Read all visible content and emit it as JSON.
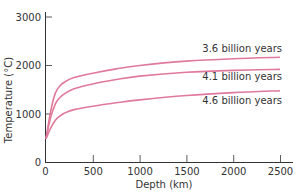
{
  "chart_data": {
    "type": "line",
    "title": "",
    "xlabel": "Depth (km)",
    "ylabel": "Temperature (°C)",
    "xlim": [
      0,
      2600
    ],
    "ylim": [
      0,
      3100
    ],
    "x_ticks": [
      0,
      500,
      1000,
      1500,
      2000,
      2500
    ],
    "y_ticks": [
      0,
      1000,
      2000,
      3000
    ],
    "x_tick_labels": [
      "0",
      "500",
      "1000",
      "1500",
      "2000",
      "2500"
    ],
    "y_tick_labels": [
      "0",
      "1000",
      "2000",
      "3000"
    ],
    "grid": false,
    "legend": "inline labels at right end of curves",
    "line_color": "#e07a9a",
    "x": [
      0,
      50,
      100,
      150,
      200,
      300,
      500,
      750,
      1000,
      1500,
      2000,
      2500
    ],
    "series": [
      {
        "name": "3.6 billion years",
        "values": [
          480,
          1050,
          1420,
          1570,
          1650,
          1740,
          1830,
          1920,
          1990,
          2080,
          2130,
          2160
        ]
      },
      {
        "name": "4.1 billion years",
        "values": [
          480,
          920,
          1200,
          1330,
          1410,
          1510,
          1610,
          1700,
          1770,
          1850,
          1890,
          1910
        ]
      },
      {
        "name": "4.6 billion years",
        "values": [
          480,
          700,
          860,
          950,
          1010,
          1080,
          1150,
          1220,
          1280,
          1370,
          1430,
          1470
        ]
      }
    ]
  },
  "labels": {
    "series_0": "3.6 billion years",
    "series_1": "4.1 billion years",
    "series_2": "4.6 billion years",
    "x_axis": "Depth (km)",
    "y_axis": "Temperature (°C)"
  }
}
